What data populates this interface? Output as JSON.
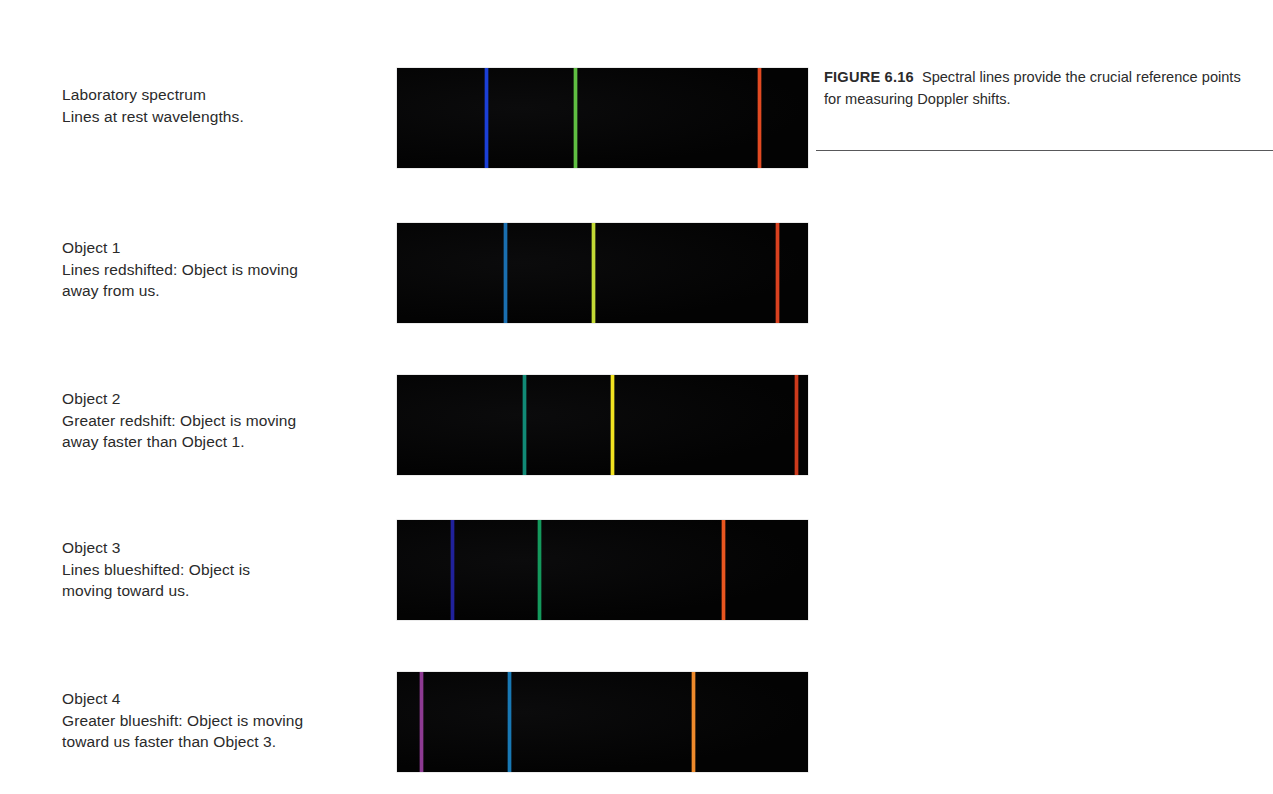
{
  "figure": {
    "number_label": "FIGURE 6.16",
    "caption_text": "Spectral lines provide the crucial reference points for measuring Doppler shifts."
  },
  "rows": [
    {
      "name": "laboratory-spectrum",
      "title": "Laboratory spectrum",
      "description": "Lines at rest wavelengths."
    },
    {
      "name": "object-1",
      "title": "Object 1",
      "description": "Lines redshifted: Object is moving\naway from us."
    },
    {
      "name": "object-2",
      "title": "Object 2",
      "description": "Greater redshift: Object is moving\naway faster than Object 1."
    },
    {
      "name": "object-3",
      "title": "Object 3",
      "description": "Lines blueshifted: Object is\nmoving toward us."
    },
    {
      "name": "object-4",
      "title": "Object 4",
      "description": "Greater blueshift: Object is moving\ntoward us faster than Object 3."
    }
  ],
  "chart_data": {
    "type": "spectrum-strips",
    "title": "Spectral lines provide the crucial reference points for measuring Doppler shifts.",
    "xlabel": "wavelength (increasing to the right)",
    "ylabel": "",
    "background_color": "#050505",
    "strip_geometry": {
      "left_px": 397,
      "width_px": 411,
      "height_px": 100,
      "tops_px": [
        68,
        223,
        375,
        520,
        672
      ]
    },
    "series": [
      {
        "name": "Laboratory spectrum",
        "shift": "rest",
        "lines": [
          {
            "label": "blue line",
            "x_px": 486,
            "color": "#1b3fd6"
          },
          {
            "label": "green line",
            "x_px": 575,
            "color": "#5fbf42"
          },
          {
            "label": "red line",
            "x_px": 759,
            "color": "#e24a22"
          }
        ]
      },
      {
        "name": "Object 1",
        "shift": "redshift",
        "lines": [
          {
            "label": "blue line",
            "x_px": 505,
            "color": "#1a6fb0"
          },
          {
            "label": "green line",
            "x_px": 593,
            "color": "#c3da35"
          },
          {
            "label": "red line",
            "x_px": 777,
            "color": "#d9411f"
          }
        ]
      },
      {
        "name": "Object 2",
        "shift": "greater-redshift",
        "lines": [
          {
            "label": "blue line",
            "x_px": 524,
            "color": "#118a76"
          },
          {
            "label": "green line",
            "x_px": 612,
            "color": "#f2e320"
          },
          {
            "label": "red line",
            "x_px": 796,
            "color": "#cc3a1c"
          }
        ]
      },
      {
        "name": "Object 3",
        "shift": "blueshift",
        "lines": [
          {
            "label": "blue line",
            "x_px": 452,
            "color": "#20219b"
          },
          {
            "label": "green line",
            "x_px": 539,
            "color": "#14995c"
          },
          {
            "label": "red line",
            "x_px": 723,
            "color": "#e8561f"
          }
        ]
      },
      {
        "name": "Object 4",
        "shift": "greater-blueshift",
        "lines": [
          {
            "label": "blue line",
            "x_px": 421,
            "color": "#8d3a92"
          },
          {
            "label": "green line",
            "x_px": 509,
            "color": "#1878b4"
          },
          {
            "label": "red line",
            "x_px": 693,
            "color": "#ef8a2b"
          }
        ]
      }
    ]
  }
}
